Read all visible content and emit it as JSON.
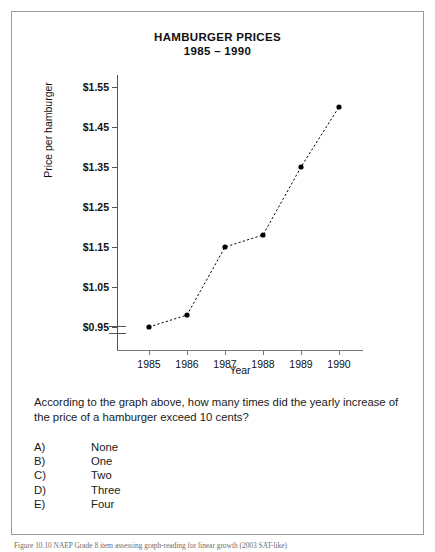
{
  "chart_data": {
    "type": "line",
    "title": "HAMBURGER PRICES",
    "subtitle": "1985 – 1990",
    "xlabel": "Year",
    "ylabel": "Price per hamburger",
    "categories": [
      "1985",
      "1986",
      "1987",
      "1988",
      "1989",
      "1990"
    ],
    "values": [
      0.95,
      0.98,
      1.15,
      1.18,
      1.35,
      1.5
    ],
    "ytick_labels": [
      "$1.55",
      "$1.45",
      "$1.35",
      "$1.25",
      "$1.15",
      "$1.05",
      "$0.95"
    ],
    "ytick_values": [
      1.55,
      1.45,
      1.35,
      1.25,
      1.15,
      1.05,
      0.95
    ],
    "ylim": [
      0.95,
      1.55
    ],
    "axis_break": true,
    "grid": false,
    "legend": "none",
    "line_style": "dashed",
    "marker": "filled-circle",
    "series_color": "#000000"
  },
  "question": {
    "text": "According to the graph above, how many times did the yearly increase of the price of a hamburger exceed 10 cents?",
    "choices": [
      {
        "letter": "A)",
        "label": "None"
      },
      {
        "letter": "B)",
        "label": "One"
      },
      {
        "letter": "C)",
        "label": "Two"
      },
      {
        "letter": "D)",
        "label": "Three"
      },
      {
        "letter": "E)",
        "label": "Four"
      }
    ]
  },
  "caption": {
    "text": "Figure 10.10 NAEP Grade 8 item assessing graph-reading for linear growth (2003 SAT-like)"
  }
}
